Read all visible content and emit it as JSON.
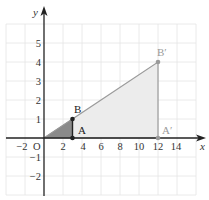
{
  "figure": {
    "axes": {
      "x_label": "x",
      "y_label": "y",
      "origin_label": "O",
      "x_ticks": [
        {
          "value": -2,
          "label": "−2"
        },
        {
          "value": 2,
          "label": "2"
        },
        {
          "value": 4,
          "label": "4"
        },
        {
          "value": 6,
          "label": "6"
        },
        {
          "value": 8,
          "label": "8"
        },
        {
          "value": 10,
          "label": "10"
        },
        {
          "value": 12,
          "label": "12"
        },
        {
          "value": 14,
          "label": "14"
        }
      ],
      "y_ticks": [
        {
          "value": 5,
          "label": "5"
        },
        {
          "value": 4,
          "label": "4"
        },
        {
          "value": 3,
          "label": "3"
        },
        {
          "value": 2,
          "label": "2"
        },
        {
          "value": 1,
          "label": "1"
        },
        {
          "value": -1,
          "label": "−1"
        },
        {
          "value": -2,
          "label": "−2"
        }
      ],
      "x_range": [
        -4,
        16
      ],
      "y_range": [
        -3,
        6
      ],
      "grid": true
    },
    "points": {
      "O": {
        "label": "O",
        "x": 0,
        "y": 0
      },
      "A": {
        "label": "A",
        "x": 3,
        "y": 0
      },
      "B": {
        "label": "B",
        "x": 3,
        "y": 1
      },
      "A_prime": {
        "label": "A′",
        "x": 12,
        "y": 0
      },
      "B_prime": {
        "label": "B′",
        "x": 12,
        "y": 4
      }
    },
    "shapes": {
      "small_triangle": {
        "vertices": [
          "O",
          "A",
          "B"
        ],
        "fill": "#8a8a8a",
        "stroke": "#222222"
      },
      "large_triangle": {
        "vertices": [
          "O",
          "A_prime",
          "B_prime"
        ],
        "fill": "#ececec",
        "stroke": "#9a9a9a"
      }
    },
    "colors": {
      "grid": "#e4e4e4",
      "axis": "#222222",
      "image_label": "#9a9a9a",
      "original_label": "#222222"
    }
  }
}
